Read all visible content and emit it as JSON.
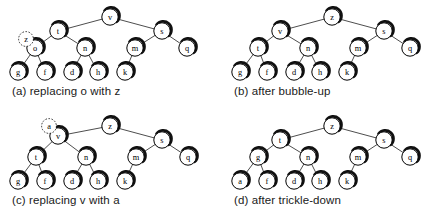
{
  "figure": {
    "background_color": "#ffffff",
    "node_fill": "#ffffff",
    "node_stroke": "#000000",
    "edge_color": "#3a3a3a",
    "shadow_color": "#111111",
    "node_radius": 8.2,
    "ghost_radius": 7.4
  },
  "panels": [
    {
      "id": "a",
      "caption": "(a) replacing o with z",
      "nodes": [
        {
          "label": "v",
          "x": 110,
          "y": 17,
          "ghost": false
        },
        {
          "label": "t",
          "x": 58,
          "y": 31,
          "ghost": false
        },
        {
          "label": "s",
          "x": 162,
          "y": 31,
          "ghost": false
        },
        {
          "label": "o",
          "x": 35,
          "y": 48,
          "ghost": false
        },
        {
          "label": "n",
          "x": 85,
          "y": 48,
          "ghost": false
        },
        {
          "label": "m",
          "x": 135,
          "y": 48,
          "ghost": false
        },
        {
          "label": "q",
          "x": 187,
          "y": 48,
          "ghost": false
        },
        {
          "label": "g",
          "x": 18,
          "y": 72,
          "ghost": false
        },
        {
          "label": "f",
          "x": 45,
          "y": 72,
          "ghost": false
        },
        {
          "label": "d",
          "x": 72,
          "y": 72,
          "ghost": false
        },
        {
          "label": "h",
          "x": 98,
          "y": 72,
          "ghost": false
        },
        {
          "label": "k",
          "x": 125,
          "y": 72,
          "ghost": false
        },
        {
          "label": "z",
          "x": 26,
          "y": 39,
          "ghost": true
        }
      ],
      "edges": [
        [
          110,
          17,
          58,
          31
        ],
        [
          110,
          17,
          162,
          31
        ],
        [
          58,
          31,
          35,
          48
        ],
        [
          58,
          31,
          85,
          48
        ],
        [
          162,
          31,
          135,
          48
        ],
        [
          162,
          31,
          187,
          48
        ],
        [
          35,
          48,
          18,
          72
        ],
        [
          35,
          48,
          45,
          72
        ],
        [
          85,
          48,
          72,
          72
        ],
        [
          85,
          48,
          98,
          72
        ],
        [
          135,
          48,
          125,
          72
        ]
      ]
    },
    {
      "id": "b",
      "caption": "(b) after bubble-up",
      "nodes": [
        {
          "label": "z",
          "x": 110,
          "y": 17,
          "ghost": false
        },
        {
          "label": "v",
          "x": 58,
          "y": 31,
          "ghost": false
        },
        {
          "label": "s",
          "x": 162,
          "y": 31,
          "ghost": false
        },
        {
          "label": "t",
          "x": 36,
          "y": 48,
          "ghost": false
        },
        {
          "label": "n",
          "x": 86,
          "y": 48,
          "ghost": false
        },
        {
          "label": "m",
          "x": 136,
          "y": 48,
          "ghost": false
        },
        {
          "label": "q",
          "x": 188,
          "y": 48,
          "ghost": false
        },
        {
          "label": "g",
          "x": 18,
          "y": 72,
          "ghost": false
        },
        {
          "label": "f",
          "x": 45,
          "y": 72,
          "ghost": false
        },
        {
          "label": "d",
          "x": 72,
          "y": 72,
          "ghost": false
        },
        {
          "label": "h",
          "x": 98,
          "y": 72,
          "ghost": false
        },
        {
          "label": "k",
          "x": 125,
          "y": 72,
          "ghost": false
        }
      ],
      "edges": [
        [
          110,
          17,
          58,
          31
        ],
        [
          110,
          17,
          162,
          31
        ],
        [
          58,
          31,
          36,
          48
        ],
        [
          58,
          31,
          86,
          48
        ],
        [
          162,
          31,
          136,
          48
        ],
        [
          162,
          31,
          188,
          48
        ],
        [
          36,
          48,
          18,
          72
        ],
        [
          36,
          48,
          45,
          72
        ],
        [
          86,
          48,
          72,
          72
        ],
        [
          86,
          48,
          98,
          72
        ],
        [
          136,
          48,
          125,
          72
        ]
      ]
    },
    {
      "id": "c",
      "caption": "(c) replacing v with a",
      "nodes": [
        {
          "label": "z",
          "x": 110,
          "y": 17,
          "ghost": false
        },
        {
          "label": "v",
          "x": 58,
          "y": 27,
          "ghost": false
        },
        {
          "label": "s",
          "x": 162,
          "y": 31,
          "ghost": false
        },
        {
          "label": "t",
          "x": 36,
          "y": 48,
          "ghost": false
        },
        {
          "label": "n",
          "x": 86,
          "y": 48,
          "ghost": false
        },
        {
          "label": "m",
          "x": 136,
          "y": 48,
          "ghost": false
        },
        {
          "label": "q",
          "x": 188,
          "y": 48,
          "ghost": false
        },
        {
          "label": "g",
          "x": 18,
          "y": 72,
          "ghost": false
        },
        {
          "label": "f",
          "x": 45,
          "y": 72,
          "ghost": false
        },
        {
          "label": "d",
          "x": 72,
          "y": 72,
          "ghost": false
        },
        {
          "label": "h",
          "x": 98,
          "y": 72,
          "ghost": false
        },
        {
          "label": "k",
          "x": 125,
          "y": 72,
          "ghost": false
        },
        {
          "label": "a",
          "x": 49,
          "y": 17,
          "ghost": true
        }
      ],
      "edges": [
        [
          110,
          17,
          58,
          27
        ],
        [
          110,
          17,
          162,
          31
        ],
        [
          58,
          27,
          36,
          48
        ],
        [
          58,
          27,
          86,
          48
        ],
        [
          162,
          31,
          136,
          48
        ],
        [
          162,
          31,
          188,
          48
        ],
        [
          36,
          48,
          18,
          72
        ],
        [
          36,
          48,
          45,
          72
        ],
        [
          86,
          48,
          72,
          72
        ],
        [
          86,
          48,
          98,
          72
        ],
        [
          136,
          48,
          125,
          72
        ]
      ]
    },
    {
      "id": "d",
      "caption": "(d) after trickle-down",
      "nodes": [
        {
          "label": "z",
          "x": 110,
          "y": 17,
          "ghost": false
        },
        {
          "label": "t",
          "x": 58,
          "y": 31,
          "ghost": false
        },
        {
          "label": "s",
          "x": 162,
          "y": 31,
          "ghost": false
        },
        {
          "label": "g",
          "x": 36,
          "y": 48,
          "ghost": false
        },
        {
          "label": "n",
          "x": 86,
          "y": 48,
          "ghost": false
        },
        {
          "label": "m",
          "x": 136,
          "y": 48,
          "ghost": false
        },
        {
          "label": "q",
          "x": 188,
          "y": 48,
          "ghost": false
        },
        {
          "label": "a",
          "x": 18,
          "y": 72,
          "ghost": false
        },
        {
          "label": "f",
          "x": 45,
          "y": 72,
          "ghost": false
        },
        {
          "label": "d",
          "x": 72,
          "y": 72,
          "ghost": false
        },
        {
          "label": "h",
          "x": 98,
          "y": 72,
          "ghost": false
        },
        {
          "label": "k",
          "x": 125,
          "y": 72,
          "ghost": false
        }
      ],
      "edges": [
        [
          110,
          17,
          58,
          31
        ],
        [
          110,
          17,
          162,
          31
        ],
        [
          58,
          31,
          36,
          48
        ],
        [
          58,
          31,
          86,
          48
        ],
        [
          162,
          31,
          136,
          48
        ],
        [
          162,
          31,
          188,
          48
        ],
        [
          36,
          48,
          18,
          72
        ],
        [
          36,
          48,
          45,
          72
        ],
        [
          86,
          48,
          72,
          72
        ],
        [
          86,
          48,
          98,
          72
        ],
        [
          136,
          48,
          125,
          72
        ]
      ]
    }
  ]
}
